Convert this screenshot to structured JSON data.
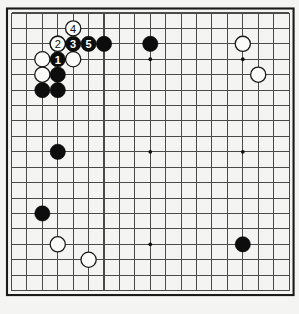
{
  "diagram": {
    "kind": "go-board-diagram",
    "board_size": 19,
    "visible_columns": 19,
    "visible_rows": 19,
    "geometry": {
      "origin_x": 11.5,
      "origin_y": 13.0,
      "spacing": 15.42,
      "stone_radius": 7.6,
      "border_inset": 4.5
    },
    "colors": {
      "board": "#f4f4f2",
      "grid": "#4a4a4a",
      "border": "#1a1a1a",
      "black_stone": "#0d0d0d",
      "white_stone": "#fbfbfa",
      "black_number_text": "#ffffff",
      "white_number_text": "#101010"
    },
    "star_points": [
      {
        "col": 3,
        "row": 3
      },
      {
        "col": 9,
        "row": 3
      },
      {
        "col": 15,
        "row": 3
      },
      {
        "col": 3,
        "row": 9
      },
      {
        "col": 9,
        "row": 9
      },
      {
        "col": 15,
        "row": 9
      },
      {
        "col": 3,
        "row": 15
      },
      {
        "col": 9,
        "row": 15
      },
      {
        "col": 15,
        "row": 15
      }
    ],
    "stones": [
      {
        "id": "w-c3r2",
        "color": "white",
        "col": 3,
        "row": 2,
        "label": ""
      },
      {
        "id": "w-c2r3",
        "color": "white",
        "col": 2,
        "row": 3,
        "label": ""
      },
      {
        "id": "w-c2r4",
        "color": "white",
        "col": 2,
        "row": 4,
        "label": ""
      },
      {
        "id": "w-c4r3",
        "color": "white",
        "col": 4,
        "row": 3,
        "label": ""
      },
      {
        "id": "b-c3r4",
        "color": "black",
        "col": 3,
        "row": 4,
        "label": ""
      },
      {
        "id": "b-c2r5",
        "color": "black",
        "col": 2,
        "row": 5,
        "label": ""
      },
      {
        "id": "b-c3r5",
        "color": "black",
        "col": 3,
        "row": 5,
        "label": ""
      },
      {
        "id": "b-c6r2",
        "color": "black",
        "col": 6,
        "row": 2,
        "label": ""
      },
      {
        "id": "b-c9r2",
        "color": "black",
        "col": 9,
        "row": 2,
        "label": ""
      },
      {
        "id": "w-c15r2",
        "color": "white",
        "col": 15,
        "row": 2,
        "label": ""
      },
      {
        "id": "w-c16r4",
        "color": "white",
        "col": 16,
        "row": 4,
        "label": ""
      },
      {
        "id": "b-c3r9",
        "color": "black",
        "col": 3,
        "row": 9,
        "label": ""
      },
      {
        "id": "b-c2r13",
        "color": "black",
        "col": 2,
        "row": 13,
        "label": ""
      },
      {
        "id": "b-c15r15",
        "color": "black",
        "col": 15,
        "row": 15,
        "label": ""
      },
      {
        "id": "w-c3r15",
        "color": "white",
        "col": 3,
        "row": 15,
        "label": ""
      },
      {
        "id": "w-c5r16",
        "color": "white",
        "col": 5,
        "row": 16,
        "label": ""
      },
      {
        "id": "move-1",
        "color": "black",
        "col": 3,
        "row": 3,
        "label": "1"
      },
      {
        "id": "move-2",
        "color": "white",
        "col": 3,
        "row": 2,
        "label": "2"
      },
      {
        "id": "move-3",
        "color": "black",
        "col": 4,
        "row": 2,
        "label": "3"
      },
      {
        "id": "move-4",
        "color": "white",
        "col": 4,
        "row": 1,
        "label": "4"
      },
      {
        "id": "move-5",
        "color": "black",
        "col": 5,
        "row": 2,
        "label": "5"
      }
    ],
    "move_sequence": [
      {
        "number": "1",
        "color": "black"
      },
      {
        "number": "2",
        "color": "white"
      },
      {
        "number": "3",
        "color": "black"
      },
      {
        "number": "4",
        "color": "white"
      },
      {
        "number": "5",
        "color": "black"
      }
    ]
  }
}
